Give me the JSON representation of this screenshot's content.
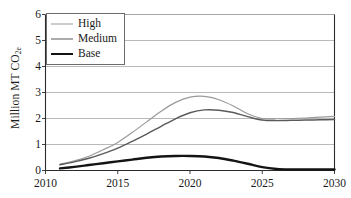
{
  "chart_data": {
    "type": "line",
    "title": "",
    "xlabel": "",
    "ylabel": "Million MT CO2e",
    "ylabel_main": "Million MT CO",
    "ylabel_sub": "2e",
    "xlim": [
      2010,
      2030
    ],
    "ylim": [
      0,
      6
    ],
    "grid": "horizontal",
    "legend_position": "top-left",
    "x_ticks": [
      "2010",
      "2015",
      "2020",
      "2025",
      "2030"
    ],
    "x_tick_values": [
      2010,
      2015,
      2020,
      2025,
      2030
    ],
    "y_ticks": [
      "0",
      "1",
      "2",
      "3",
      "4",
      "5",
      "6"
    ],
    "y_tick_values": [
      0,
      1,
      2,
      3,
      4,
      5,
      6
    ],
    "x": [
      2011,
      2012,
      2013,
      2014,
      2015,
      2016,
      2017,
      2018,
      2019,
      2020,
      2021,
      2022,
      2023,
      2024,
      2025,
      2026,
      2027,
      2028,
      2029,
      2030
    ],
    "series": [
      {
        "name": "High",
        "color": "#9a9a9a",
        "width": 1.2,
        "values": [
          0.24,
          0.37,
          0.55,
          0.8,
          1.08,
          1.46,
          1.87,
          2.28,
          2.62,
          2.82,
          2.85,
          2.72,
          2.48,
          2.18,
          2.0,
          1.99,
          2.0,
          2.02,
          2.05,
          2.08
        ]
      },
      {
        "name": "Medium",
        "color": "#5a5a5a",
        "width": 1.4,
        "values": [
          0.22,
          0.33,
          0.47,
          0.65,
          0.86,
          1.12,
          1.4,
          1.7,
          1.99,
          2.22,
          2.33,
          2.32,
          2.23,
          2.07,
          1.94,
          1.92,
          1.93,
          1.94,
          1.95,
          1.96
        ]
      },
      {
        "name": "Base",
        "color": "#141414",
        "width": 2.4,
        "values": [
          0.08,
          0.14,
          0.21,
          0.28,
          0.35,
          0.42,
          0.49,
          0.54,
          0.56,
          0.56,
          0.54,
          0.48,
          0.38,
          0.26,
          0.13,
          0.06,
          0.04,
          0.04,
          0.04,
          0.04
        ]
      }
    ]
  },
  "legend": {
    "items": [
      {
        "label": "High"
      },
      {
        "label": "Medium"
      },
      {
        "label": "Base"
      }
    ]
  },
  "colors": {
    "frame": "#2b2b2b",
    "grid": "#9b9b9b",
    "high": "#9a9a9a",
    "medium": "#5a5a5a",
    "base": "#141414",
    "legend_border": "#6d6d6d",
    "background": "#ffffff"
  }
}
